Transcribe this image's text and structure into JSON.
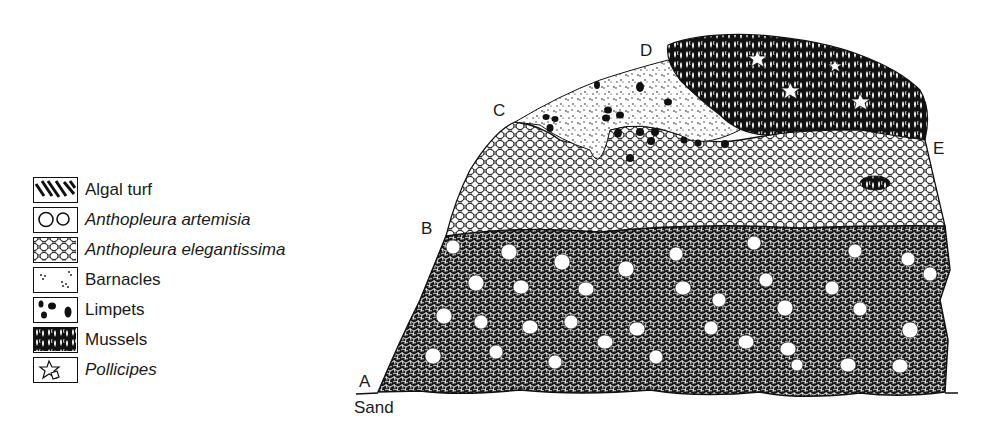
{
  "figure": {
    "type": "intertidal zonation cross-section",
    "substrate_label": "Sand"
  },
  "legend": {
    "items": [
      {
        "label": "Algal turf",
        "italic": false,
        "icon": "algal-turf-pattern"
      },
      {
        "label": "Anthopleura artemisia",
        "italic": true,
        "icon": "anemone-circles-pattern"
      },
      {
        "label": "Anthopleura elegantissima",
        "italic": true,
        "icon": "anemone-mesh-pattern"
      },
      {
        "label": "Barnacles",
        "italic": false,
        "icon": "barnacle-dots-pattern"
      },
      {
        "label": "Limpets",
        "italic": false,
        "icon": "limpet-blobs-pattern"
      },
      {
        "label": "Mussels",
        "italic": false,
        "icon": "mussel-cluster-pattern"
      },
      {
        "label": "Pollicipes",
        "italic": true,
        "icon": "pollicipes-star-pattern"
      }
    ]
  },
  "points": [
    {
      "id": "A",
      "label": "A"
    },
    {
      "id": "B",
      "label": "B"
    },
    {
      "id": "C",
      "label": "C"
    },
    {
      "id": "D",
      "label": "D"
    },
    {
      "id": "E",
      "label": "E"
    }
  ],
  "zones": [
    {
      "name": "Anthopleura artemisia in algal turf / dark mesh",
      "from": "A",
      "to": "B"
    },
    {
      "name": "Anthopleura elegantissima",
      "from": "B",
      "to": "C"
    },
    {
      "name": "Barnacles and limpets",
      "from": "C",
      "to": "D"
    },
    {
      "name": "Mussels with Pollicipes",
      "from": "D",
      "to": "E"
    }
  ],
  "colors": {
    "ink": "#111111",
    "paper": "#ffffff"
  }
}
